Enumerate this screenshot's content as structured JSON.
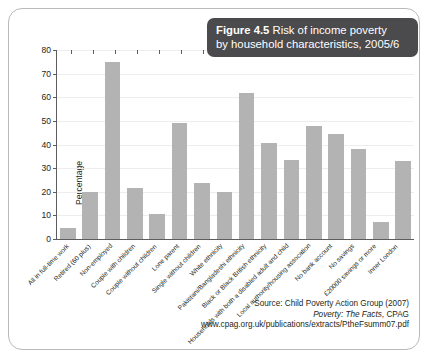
{
  "figure": {
    "title_label": "Figure 4.5",
    "title_rest": " Risk of income poverty",
    "title_line2": "by household characteristics, 2005/6",
    "banner_color": "#4b4a4c",
    "bar_color": "#b3b3b3"
  },
  "source": {
    "line1": "Source: Child Poverty Action Group (2007)",
    "line2_italic": "Poverty: The Facts",
    "line2_rest": ", CPAG",
    "line3": "www.cpag.org.uk/publications/extracts/PtheFsumm07.pdf"
  },
  "chart_data": {
    "type": "bar",
    "title": "Figure 4.5 Risk of income poverty by household characteristics, 2005/6",
    "xlabel": "",
    "ylabel": "Percentage",
    "ylim": [
      0,
      80
    ],
    "yticks": [
      0,
      10,
      20,
      30,
      40,
      50,
      60,
      70,
      80
    ],
    "grid": true,
    "legend": "none",
    "categories": [
      "All in full-time work",
      "Retired (60 plus)",
      "Non-employed",
      "Couple with children",
      "Couple without children",
      "Lone parent",
      "Single without children",
      "White ethnicity",
      "Pakistani/Bangladeshi ethnicity",
      "Black or Black British ethnicity",
      "Households with both a disabled adult and child",
      "Local authority/housing assocation",
      "No bank account",
      "No savings",
      "£20000 savings or more",
      "Inner London"
    ],
    "values": [
      4.5,
      20,
      75,
      21.5,
      10.5,
      49,
      23.5,
      20,
      62,
      40.5,
      33.5,
      48,
      44.5,
      38,
      7,
      33
    ]
  }
}
